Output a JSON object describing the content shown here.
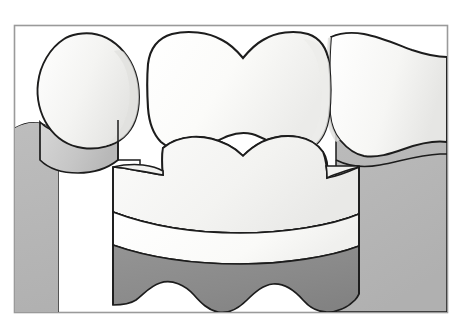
{
  "figure": {
    "title": "Dental cross-section illustration of three teeth",
    "domain_label": "dental-anatomy-illustration",
    "width": 458,
    "height": 333
  },
  "canvas": {
    "background_color": "#ffffff",
    "frame_color": "#9a9a9a",
    "frame_inner_color": "#ffffff",
    "frame": {
      "x": 14,
      "y": 25,
      "width": 434,
      "height": 288
    }
  },
  "palette": {
    "outline": "#1c1c1c",
    "enamel_light": "#f7f7f5",
    "enamel_shade": "#ececeb",
    "enamel_deep_shade": "#e2e2e0",
    "gum_light": "#c3c3c3",
    "gum_mid": "#b4b4b4",
    "gum_shadow": "#a8a8a8",
    "dentin_gray": "#b0b0b0",
    "dentin_gray_shade": "#a4a4a4",
    "base_band_dark": "#8a8a8a",
    "band_cream": "#f4f4f2",
    "caries_black": "#111111"
  },
  "elements": {
    "left_tooth": {
      "name": "Left tooth crown",
      "fill": "#f1f1ef",
      "root_fill": "#c8c8c8",
      "note": "Partially visible premolar crown at left, rounded outline, root shaft descending into gum"
    },
    "center_tooth": {
      "name": "Center molar, cross-sectioned",
      "crown_fill": "#f7f7f5",
      "note": "Large molar with characteristic dipped occlusal outline at top"
    },
    "right_tooth": {
      "name": "Right tooth crown",
      "fill": "#f7f7f5",
      "note": "Partially visible molar at right edge, cut off by the frame"
    },
    "occlusal_table": {
      "name": "Prepared occlusal / dentin table",
      "fill": "#b0b0b0",
      "note": "Two rounded gray lobes forming the cut tooth surface"
    },
    "caries_lesion": {
      "name": "Carious lesion",
      "fill": "#111111",
      "shape": "triangular notch",
      "note": "Small dark triangular defect in the central fissure between the two lobes"
    },
    "band_upper": {
      "name": "Upper restorative / enamel band",
      "fill": "#f4f4f2"
    },
    "band_lower": {
      "name": "Lower restorative / dentin band",
      "fill": "#fbfbfa"
    },
    "band_base": {
      "name": "Base band",
      "fill": "#8a8a8a",
      "note": "Dark gray band with scalloped lower margin"
    },
    "gum_tissue": {
      "name": "Gingival tissue",
      "fill": "#b4b4b4",
      "note": "Surrounding gum with undulating margin scalloped around each tooth"
    }
  }
}
